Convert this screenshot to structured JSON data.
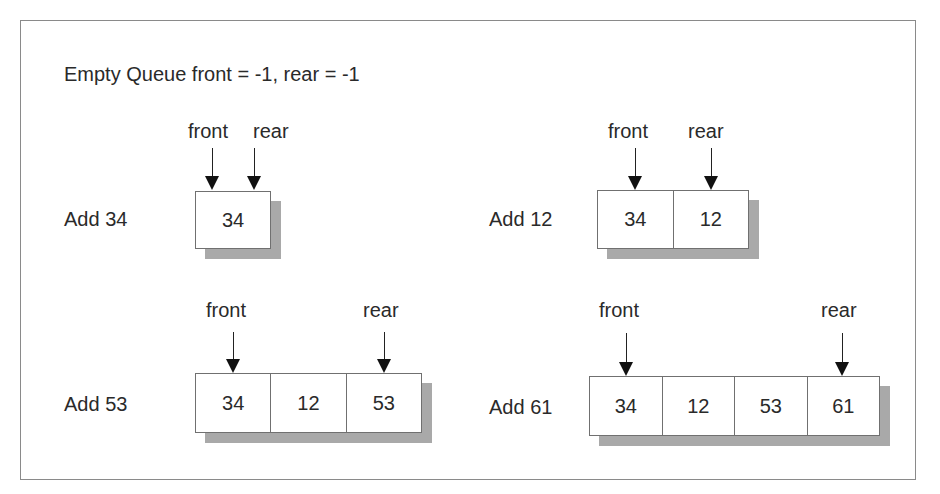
{
  "title": "Empty Queue  front = -1, rear = -1",
  "pointer_labels": {
    "front": "front",
    "rear": "rear"
  },
  "steps": [
    {
      "label": "Add 34",
      "cells": [
        "34"
      ],
      "front_index": 0,
      "rear_index": 0
    },
    {
      "label": "Add 12",
      "cells": [
        "34",
        "12"
      ],
      "front_index": 0,
      "rear_index": 1
    },
    {
      "label": "Add 53",
      "cells": [
        "34",
        "12",
        "53"
      ],
      "front_index": 0,
      "rear_index": 2
    },
    {
      "label": "Add 61",
      "cells": [
        "34",
        "12",
        "53",
        "61"
      ],
      "front_index": 0,
      "rear_index": 3
    }
  ],
  "colors": {
    "border": "#707070",
    "shadow": "#a9a9a9",
    "text": "#2a2a2a",
    "arrow": "#111111"
  }
}
